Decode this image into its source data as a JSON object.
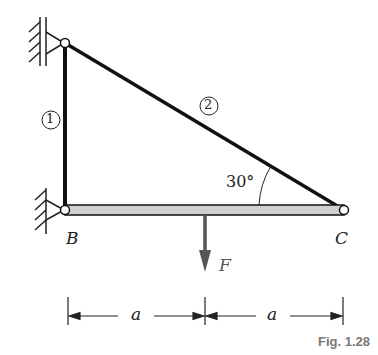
{
  "figure": {
    "caption": "Fig. 1.28",
    "members": [
      {
        "id": "1",
        "label": "1"
      },
      {
        "id": "2",
        "label": "2"
      }
    ],
    "points": {
      "B": "B",
      "C": "C"
    },
    "angle": "30°",
    "force": "F",
    "dimensions": [
      "a",
      "a"
    ],
    "colors": {
      "line": "#111111",
      "beam_fill": "#d0d0d0",
      "force_arrow": "#555555",
      "caption": "#777777"
    }
  }
}
